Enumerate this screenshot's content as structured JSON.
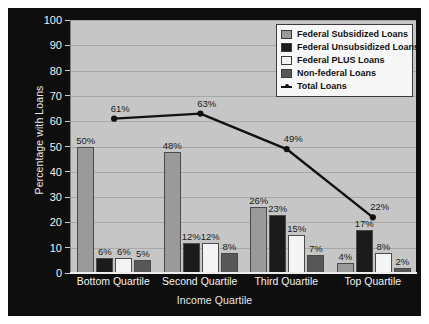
{
  "chart_data": {
    "type": "bar",
    "title": "",
    "xlabel": "Income Quartile",
    "ylabel": "Percentage with Loans",
    "ylim": [
      0,
      100
    ],
    "ytick_step": 10,
    "yticks": [
      100,
      90,
      80,
      70,
      60,
      50,
      40,
      30,
      20,
      10,
      0
    ],
    "grid": true,
    "legend_position": "top-right",
    "categories": [
      "Bottom Quartile",
      "Second Quartile",
      "Third Quartile",
      "Top Quartile"
    ],
    "series": [
      {
        "name": "Federal Subsidized Loans",
        "type": "bar",
        "color": "#9a9a9a",
        "values": [
          50,
          48,
          26,
          4
        ],
        "labels": [
          "50%",
          "48%",
          "26%",
          "4%"
        ]
      },
      {
        "name": "Federal Unsubsidized Loans",
        "type": "bar",
        "color": "#1b1b1b",
        "values": [
          6,
          12,
          23,
          17
        ],
        "labels": [
          "6%",
          "12%",
          "23%",
          "17%"
        ]
      },
      {
        "name": "Federal PLUS Loans",
        "type": "bar",
        "color": "#f4f4f4",
        "values": [
          6,
          12,
          15,
          8
        ],
        "labels": [
          "6%",
          "12%",
          "15%",
          "8%"
        ]
      },
      {
        "name": "Non-federal Loans",
        "type": "bar",
        "color": "#575757",
        "values": [
          5,
          8,
          7,
          2
        ],
        "labels": [
          "5%",
          "8%",
          "7%",
          "2%"
        ]
      },
      {
        "name": "Total Loans",
        "type": "line",
        "color": "#111111",
        "values": [
          61,
          63,
          49,
          22
        ],
        "labels": [
          "61%",
          "63%",
          "49%",
          "22%"
        ]
      }
    ]
  },
  "legend": {
    "entries": [
      {
        "label": "Federal Subsidized Loans",
        "swatch": "#9a9a9a",
        "kind": "swatch"
      },
      {
        "label": "Federal Unsubsidized Loans",
        "swatch": "#1b1b1b",
        "kind": "swatch"
      },
      {
        "label": "Federal PLUS Loans",
        "swatch": "#f4f4f4",
        "kind": "swatch"
      },
      {
        "label": "Non-federal Loans",
        "swatch": "#575757",
        "kind": "swatch"
      },
      {
        "label": "Total Loans",
        "swatch": "#111111",
        "kind": "line"
      }
    ]
  },
  "colors": {
    "figure_background": "#0e0e0e",
    "plot_background": "#c6c6c6",
    "gridline": "#a8a8a8",
    "axis_text": "#f2f2f2",
    "data_label": "#1a1a1a"
  }
}
